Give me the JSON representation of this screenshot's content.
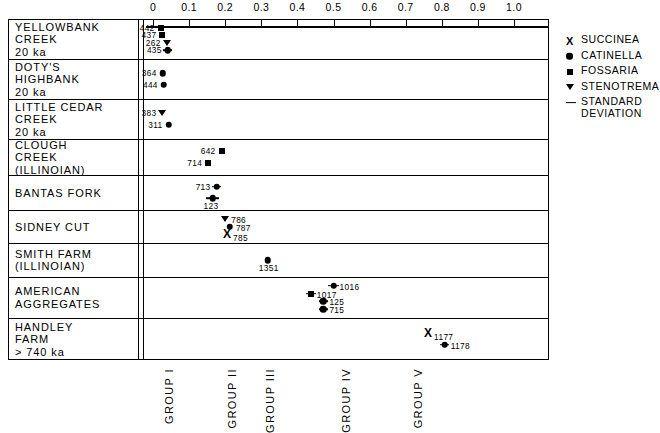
{
  "chart_data": {
    "type": "scatter",
    "title": "",
    "xlabel": "",
    "ylabel": "",
    "xlim": [
      0.0,
      1.0
    ],
    "grid": false,
    "legend_position": "right",
    "axis": {
      "ticks": [
        "0",
        "0.1",
        "0.2",
        "0.3",
        "0.4",
        "0.5",
        "0.6",
        "0.7",
        "0.8",
        "0.9",
        "1.0"
      ],
      "values": [
        0.0,
        0.1,
        0.2,
        0.3,
        0.4,
        0.5,
        0.6,
        0.7,
        0.8,
        0.9,
        1.0
      ]
    },
    "legend": [
      {
        "symbol": "x",
        "name": "succinea-symbol",
        "label": "SUCCINEA"
      },
      {
        "symbol": "circle",
        "name": "catinella-symbol",
        "label": "CATINELLA"
      },
      {
        "symbol": "square",
        "name": "fossaria-symbol",
        "label": "FOSSARIA"
      },
      {
        "symbol": "triangle",
        "name": "stenotrema-symbol",
        "label": "STENOTREMA"
      },
      {
        "symbol": "dash",
        "name": "std-deviation-symbol",
        "label": "STANDARD\nDEVIATION"
      }
    ],
    "group_labels": [
      {
        "label": "GROUP I",
        "x": 0.012
      },
      {
        "label": "GROUP II",
        "x": 0.185
      },
      {
        "label": "GROUP III",
        "x": 0.29
      },
      {
        "label": "GROUP IV",
        "x": 0.5
      },
      {
        "label": "GROUP V",
        "x": 0.7
      }
    ],
    "rows": [
      {
        "label": "YELLOWBANK\nCREEK\n20 ka",
        "points": [
          {
            "id": "442",
            "taxon": "FOSSARIA",
            "symbol": "square",
            "x": 0.021,
            "sd": 0.0,
            "label_side": "left"
          },
          {
            "id": "437",
            "taxon": "FOSSARIA",
            "symbol": "square",
            "x": 0.026,
            "sd": 0.0,
            "label_side": "left"
          },
          {
            "id": "262",
            "taxon": "STENOTREMA",
            "symbol": "triangle",
            "x": 0.038,
            "sd": 0.0,
            "label_side": "left"
          },
          {
            "id": "435",
            "taxon": "CATINELLA",
            "symbol": "circle",
            "x": 0.041,
            "sd": 0.013,
            "label_side": "left"
          }
        ]
      },
      {
        "label": "DOTY'S\nHIGHBANK\n20 ka",
        "points": [
          {
            "id": "364",
            "taxon": "CATINELLA",
            "symbol": "circle",
            "x": 0.027,
            "sd": 0.0,
            "label_side": "left"
          },
          {
            "id": "444",
            "taxon": "CATINELLA",
            "symbol": "circle",
            "x": 0.03,
            "sd": 0.0,
            "label_side": "left"
          }
        ]
      },
      {
        "label": "LITTLE CEDAR\nCREEK\n20 ka",
        "points": [
          {
            "id": "383",
            "taxon": "STENOTREMA",
            "symbol": "triangle",
            "x": 0.026,
            "sd": 0.0,
            "label_side": "left"
          },
          {
            "id": "311",
            "taxon": "CATINELLA",
            "symbol": "circle",
            "x": 0.043,
            "sd": 0.0,
            "label_side": "left"
          }
        ]
      },
      {
        "label": "CLOUGH\nCREEK\n(ILLINOIAN)",
        "points": [
          {
            "id": "642",
            "taxon": "FOSSARIA",
            "symbol": "square",
            "x": 0.19,
            "sd": 0.0,
            "label_side": "left"
          },
          {
            "id": "714",
            "taxon": "FOSSARIA",
            "symbol": "square",
            "x": 0.153,
            "sd": 0.0,
            "label_side": "left"
          }
        ]
      },
      {
        "label": "BANTAS FORK",
        "points": [
          {
            "id": "713",
            "taxon": "CATINELLA",
            "symbol": "circle",
            "x": 0.176,
            "sd": 0.013,
            "label_side": "left"
          },
          {
            "id": "123",
            "taxon": "CATINELLA",
            "symbol": "circle",
            "x": 0.165,
            "sd": 0.018,
            "label_side": "below"
          }
        ]
      },
      {
        "label": "SIDNEY CUT",
        "points": [
          {
            "id": "786",
            "taxon": "STENOTREMA",
            "symbol": "triangle",
            "x": 0.2,
            "sd": 0.0,
            "label_side": "right"
          },
          {
            "id": "787",
            "taxon": "CATINELLA",
            "symbol": "circle",
            "x": 0.213,
            "sd": 0.0,
            "label_side": "right"
          },
          {
            "id": "785",
            "taxon": "SUCCINEA",
            "symbol": "x",
            "x": 0.205,
            "sd": 0.0,
            "label_side": "right"
          }
        ]
      },
      {
        "label": "SMITH FARM\n(ILLINOIAN)",
        "points": [
          {
            "id": "1351",
            "taxon": "CATINELLA",
            "symbol": "circle",
            "x": 0.318,
            "sd": 0.0,
            "label_side": "below"
          }
        ]
      },
      {
        "label": "AMERICAN\nAGGREGATES",
        "points": [
          {
            "id": "1016",
            "taxon": "CATINELLA",
            "symbol": "circle",
            "x": 0.5,
            "sd": 0.014,
            "label_side": "right"
          },
          {
            "id": "1017",
            "taxon": "FOSSARIA",
            "symbol": "square",
            "x": 0.437,
            "sd": 0.014,
            "label_side": "right"
          },
          {
            "id": "125",
            "taxon": "CATINELLA",
            "symbol": "circle",
            "x": 0.472,
            "sd": 0.013,
            "label_side": "right"
          },
          {
            "id": "715",
            "taxon": "CATINELLA",
            "symbol": "circle",
            "x": 0.472,
            "sd": 0.013,
            "label_side": "right"
          }
        ]
      },
      {
        "label": "HANDLEY\nFARM\n> 740 ka",
        "points": [
          {
            "id": "1177",
            "taxon": "SUCCINEA",
            "symbol": "x",
            "x": 0.762,
            "sd": 0.0,
            "label_side": "right"
          },
          {
            "id": "1178",
            "taxon": "CATINELLA",
            "symbol": "circle",
            "x": 0.808,
            "sd": 0.013,
            "label_side": "right"
          }
        ]
      }
    ]
  }
}
